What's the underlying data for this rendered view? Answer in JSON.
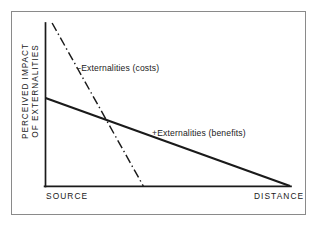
{
  "figure": {
    "background_color": "#ffffff",
    "frame_color": "#8a8a8a",
    "line_color": "#1a1a1a"
  },
  "axes": {
    "y_title_line1": "PERCEIVED IMPACT",
    "y_title_line2": "OF EXTERNALITIES",
    "x_tick_left": "SOURCE",
    "x_tick_right": "DISTANCE"
  },
  "labels": {
    "costs": "−Externalities (costs)",
    "benefits": "+Externalities (benefits)"
  },
  "chart_data": {
    "type": "line",
    "title": "",
    "subtitle": "",
    "xlabel": "DISTANCE",
    "ylabel": "PERCEIVED IMPACT OF EXTERNALITIES",
    "xlim": [
      0,
      1
    ],
    "ylim": [
      0,
      1
    ],
    "x_tick_labels": [
      "SOURCE",
      "DISTANCE"
    ],
    "x_tick_values": [
      0,
      1
    ],
    "y_tick_labels": [],
    "grid": false,
    "legend": "inline-annotations",
    "series": [
      {
        "name": "−Externalities (costs)",
        "style": "dash-dot",
        "color": "#1a1a1a",
        "x": [
          0.027,
          0.4
        ],
        "y": [
          1.0,
          0.0
        ],
        "annotation": "−Externalities (costs)",
        "note": "steeply declining negative externalities, reaches zero close to source"
      },
      {
        "name": "+Externalities (benefits)",
        "style": "solid",
        "color": "#1a1a1a",
        "x": [
          0.0,
          1.0
        ],
        "y": [
          0.54,
          0.0
        ],
        "annotation": "+Externalities (benefits)",
        "note": "gradually declining positive externalities, reaches zero at far distance"
      }
    ]
  }
}
